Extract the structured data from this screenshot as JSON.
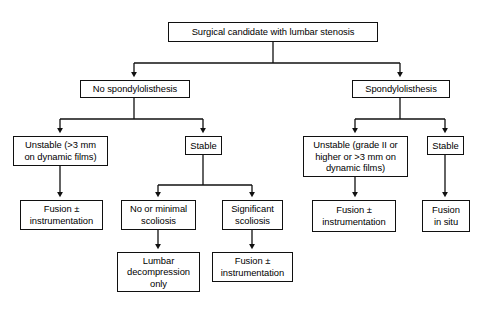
{
  "diagram": {
    "stroke_color": "#101010",
    "fill_color": "#ffffff",
    "text_color": "#000000",
    "nodes": [
      {
        "id": "root",
        "label": "Surgical candidate with lumbar stenosis",
        "x": 168,
        "y": 22,
        "w": 210,
        "h": 20,
        "level": 1
      },
      {
        "id": "no-spondylolisthesis",
        "label": "No spondylolisthesis",
        "x": 80,
        "y": 80,
        "w": 110,
        "h": 18,
        "level": 2
      },
      {
        "id": "spondylolisthesis",
        "label": "Spondylolisthesis",
        "x": 352,
        "y": 80,
        "w": 98,
        "h": 18,
        "level": 2
      },
      {
        "id": "unstable-left",
        "label": "Unstable (>3 mm\non dynamic films)",
        "x": 13,
        "y": 136,
        "w": 95,
        "h": 30,
        "level": 3
      },
      {
        "id": "stable-left",
        "label": "Stable",
        "x": 185,
        "y": 136,
        "w": 37,
        "h": 19,
        "level": 3
      },
      {
        "id": "unstable-right",
        "label": "Unstable (grade II or\nhigher or >3 mm on\ndynamic films)",
        "x": 303,
        "y": 136,
        "w": 105,
        "h": 41,
        "level": 3
      },
      {
        "id": "stable-right",
        "label": "Stable",
        "x": 427,
        "y": 136,
        "w": 37,
        "h": 19,
        "level": 3
      },
      {
        "id": "fusion-instrumentation-1",
        "label": "Fusion ±\ninstrumentation",
        "x": 20,
        "y": 200,
        "w": 83,
        "h": 30,
        "level": 4
      },
      {
        "id": "no-or-minimal-scoliosis",
        "label": "No or minimal\nscoliosis",
        "x": 121,
        "y": 200,
        "w": 75,
        "h": 30,
        "level": 4
      },
      {
        "id": "significant-scoliosis",
        "label": "Significant\nscoliosis",
        "x": 222,
        "y": 200,
        "w": 61,
        "h": 30,
        "level": 4
      },
      {
        "id": "fusion-instrumentation-2",
        "label": "Fusion ±\ninstrumentation",
        "x": 312,
        "y": 200,
        "w": 84,
        "h": 32,
        "level": 4
      },
      {
        "id": "fusion-in-situ",
        "label": "Fusion\nin situ",
        "x": 422,
        "y": 200,
        "w": 48,
        "h": 32,
        "level": 4
      },
      {
        "id": "lumbar-decompression-only",
        "label": "Lumbar\ndecompression\nonly",
        "x": 117,
        "y": 252,
        "w": 83,
        "h": 40,
        "level": 5
      },
      {
        "id": "fusion-instrumentation-3",
        "label": "Fusion ±\ninstrumentation",
        "x": 212,
        "y": 252,
        "w": 81,
        "h": 30,
        "level": 5
      }
    ],
    "edges": [
      {
        "id": "root-to-branch",
        "from": "root",
        "to": "split-1",
        "type": "fork"
      },
      {
        "id": "branch-to-no-spondylolisthesis",
        "from": "split-1",
        "to": "no-spondylolisthesis",
        "type": "arrow"
      },
      {
        "id": "branch-to-spondylolisthesis",
        "from": "split-1",
        "to": "spondylolisthesis",
        "type": "arrow"
      },
      {
        "id": "no-spondylolisthesis-to-unstable-left",
        "from": "no-spondylolisthesis",
        "to": "unstable-left",
        "type": "arrow"
      },
      {
        "id": "no-spondylolisthesis-to-stable-left",
        "from": "no-spondylolisthesis",
        "to": "stable-left",
        "type": "arrow"
      },
      {
        "id": "spondylolisthesis-to-unstable-right",
        "from": "spondylolisthesis",
        "to": "unstable-right",
        "type": "arrow"
      },
      {
        "id": "spondylolisthesis-to-stable-right",
        "from": "spondylolisthesis",
        "to": "stable-right",
        "type": "arrow"
      },
      {
        "id": "unstable-left-to-fusion-1",
        "from": "unstable-left",
        "to": "fusion-instrumentation-1",
        "type": "arrow"
      },
      {
        "id": "stable-left-to-no-or-minimal-scoliosis",
        "from": "stable-left",
        "to": "no-or-minimal-scoliosis",
        "type": "arrow"
      },
      {
        "id": "stable-left-to-significant-scoliosis",
        "from": "stable-left",
        "to": "significant-scoliosis",
        "type": "arrow"
      },
      {
        "id": "unstable-right-to-fusion-2",
        "from": "unstable-right",
        "to": "fusion-instrumentation-2",
        "type": "arrow"
      },
      {
        "id": "stable-right-to-fusion-in-situ",
        "from": "stable-right",
        "to": "fusion-in-situ",
        "type": "arrow"
      },
      {
        "id": "no-or-minimal-scoliosis-to-lumbar-decompression",
        "from": "no-or-minimal-scoliosis",
        "to": "lumbar-decompression-only",
        "type": "arrow"
      },
      {
        "id": "significant-scoliosis-to-fusion-3",
        "from": "significant-scoliosis",
        "to": "fusion-instrumentation-3",
        "type": "arrow"
      }
    ]
  }
}
